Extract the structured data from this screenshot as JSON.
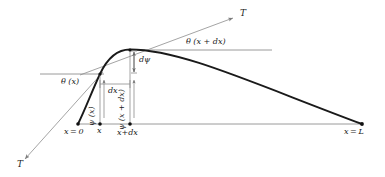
{
  "figure": {
    "type": "physics-free-body-diagram",
    "background_color": "#ffffff",
    "curve_color": "#1a1a1a",
    "guide_color": "#9a9a9a",
    "tension_line_color": "#8d8d8d",
    "label_color": "#1a1a1a"
  },
  "labels": {
    "tension_upper": "T",
    "tension_lower": "T",
    "theta_x": "θ (x)",
    "theta_x_dx": "θ (x + dx)",
    "d_psi": "dψ",
    "dx": "dx",
    "psi_x": "ψ (x)",
    "psi_x_dx": "ψ (x + dx)",
    "x_zero": "x = 0",
    "x_mid": "x",
    "x_plus_dx": "x+dx",
    "x_length": "x = L"
  },
  "geometry": {
    "baseline_y": 124,
    "x0_px": 78,
    "x_px": 100,
    "x_plus_dx_px": 130,
    "xL_px": 362,
    "point_x_y": 74,
    "point_xdx_y": 50,
    "curve_path": "M 78,124 C 86,108 92,90 100,74 C 108,60 118,50 130,50 C 180,50 250,82 362,124",
    "guide_line_lower": {
      "x1": 40,
      "y1": 74,
      "x2": 104,
      "y2": 74
    },
    "guide_line_upper": {
      "x1": 132,
      "y1": 50,
      "x2": 272,
      "y2": 50
    },
    "tension_upper_line": {
      "x1": 78,
      "y1": 76,
      "x2": 236,
      "y2": 17
    },
    "tension_lower_line": {
      "x1": 104,
      "y1": 72,
      "x2": 22,
      "y2": 163
    },
    "dx_bracket": {
      "x1": 100,
      "x2": 130,
      "y": 84
    },
    "dpsi_bracket": {
      "x": 132,
      "y1": 50,
      "y2": 74
    }
  },
  "markers": [
    {
      "name": "x-zero",
      "x": 78,
      "y": 124
    },
    {
      "name": "x",
      "x": 100,
      "y": 124
    },
    {
      "name": "x-plus-dx",
      "x": 130,
      "y": 124
    },
    {
      "name": "x-length",
      "x": 362,
      "y": 124
    },
    {
      "name": "point-on-curve-x",
      "x": 100,
      "y": 74
    },
    {
      "name": "point-on-curve-x-plus-dx",
      "x": 130,
      "y": 50
    }
  ]
}
